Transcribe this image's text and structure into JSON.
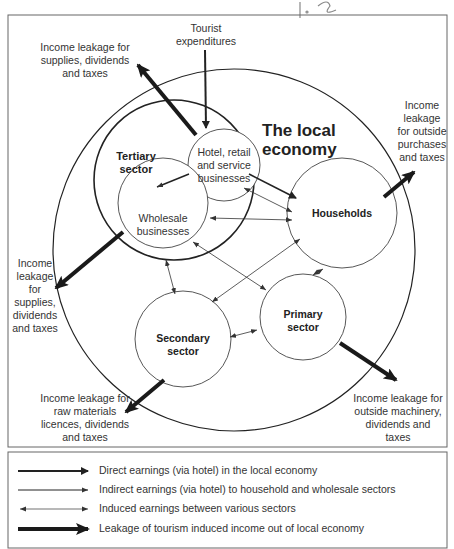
{
  "header": {
    "handwritten_mark": "1.2"
  },
  "diagram": {
    "title_line1": "The local",
    "title_line2": "economy",
    "nodes": {
      "tertiary": "Tertiary sector",
      "tertiary_l1": "Tertiary",
      "tertiary_l2": "sector",
      "hotel_l1": "Hotel, retail",
      "hotel_l2": "and service",
      "hotel_l3": "businesses",
      "wholesale_l1": "Wholesale",
      "wholesale_l2": "businesses",
      "households": "Households",
      "secondary_l1": "Secondary",
      "secondary_l2": "sector",
      "primary_l1": "Primary",
      "primary_l2": "sector"
    },
    "labels": {
      "tourist_l1": "Tourist",
      "tourist_l2": "expenditures",
      "leak_hotel_l1": "Income leakage for",
      "leak_hotel_l2": "supplies, dividends",
      "leak_hotel_l3": "and taxes",
      "leak_house_l1": "Income",
      "leak_house_l2": "leakage",
      "leak_house_l3": "for outside",
      "leak_house_l4": "purchases",
      "leak_house_l5": "and taxes",
      "leak_whole_l1": "Income",
      "leak_whole_l2": "leakage",
      "leak_whole_l3": "for",
      "leak_whole_l4": "supplies,",
      "leak_whole_l5": "dividends",
      "leak_whole_l6": "and taxes",
      "leak_sec_l1": "Income leakage for",
      "leak_sec_l2": "raw materials",
      "leak_sec_l3": "licences, dividends",
      "leak_sec_l4": "and taxes",
      "leak_prim_l1": "Income leakage for",
      "leak_prim_l2": "outside machinery,",
      "leak_prim_l3": "dividends and",
      "leak_prim_l4": "taxes"
    }
  },
  "legend": {
    "items": [
      {
        "label": "Direct earnings (via hotel) in the local economy"
      },
      {
        "label": "Indirect earnings (via hotel) to household and wholesale sectors"
      },
      {
        "label": "Induced earnings between various sectors"
      },
      {
        "label": "Leakage of tourism induced income out of local economy"
      }
    ]
  }
}
